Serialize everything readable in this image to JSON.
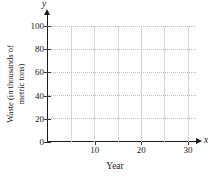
{
  "chart_data": {
    "type": "line",
    "title": "",
    "xlabel": "Year",
    "ylabel": "Waste (in thousands of metric tons)",
    "x_axis_symbol": "x",
    "y_axis_symbol": "y",
    "xlim": [
      0,
      32
    ],
    "ylim": [
      0,
      104
    ],
    "x_ticks": [
      10,
      20,
      30
    ],
    "x_gridlines": [
      5,
      10,
      15,
      20,
      25,
      30
    ],
    "y_ticks": [
      0,
      20,
      40,
      60,
      80,
      100
    ],
    "y_gridlines": [
      20,
      40,
      60,
      80,
      100
    ],
    "grid": true,
    "legend": null,
    "series": []
  },
  "colors": {
    "axis": "#1a1a1a",
    "text": "#1a1a1a",
    "h_gridline": "#c2c2c2",
    "v_gridline": "#d6d6d6",
    "background": "#ffffff"
  }
}
